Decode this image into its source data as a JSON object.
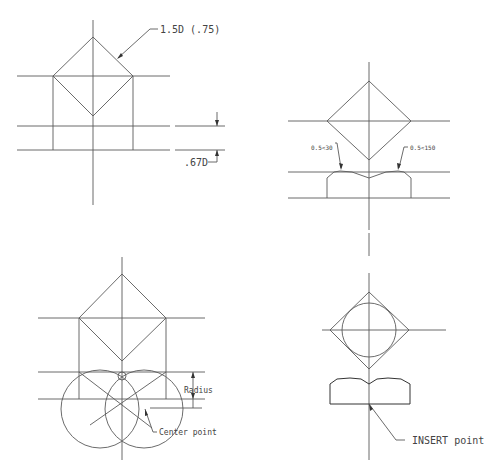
{
  "drawing": {
    "panels": [
      {
        "id": "top-left",
        "labels": {
          "diameter_note": "1.5D (.75)",
          "height_note": ".67D"
        }
      },
      {
        "id": "top-right",
        "labels": {
          "chamfer_left": "0.5<30",
          "chamfer_right": "0.5<150"
        }
      },
      {
        "id": "bottom-left",
        "labels": {
          "radius": "Radius",
          "center": "Center point"
        }
      },
      {
        "id": "bottom-right",
        "labels": {
          "insert": "INSERT point"
        }
      }
    ]
  }
}
